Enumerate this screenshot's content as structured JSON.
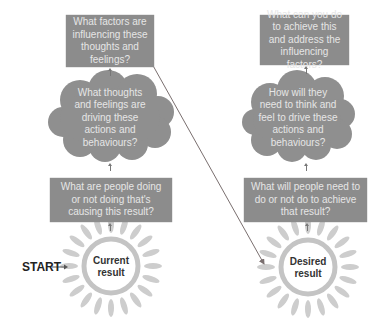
{
  "diagram": {
    "start_label": "START",
    "colors": {
      "box_fill": "#8c8c8c",
      "box_text": "#e6e6e6",
      "cloud_fill": "#8f8f8f",
      "sun_rays": "#c8c8c8",
      "connector_line": "#7a6f6f"
    },
    "left_column": {
      "top_box": "What factors are influencing these thoughts and feelings?",
      "cloud": "What thoughts and feelings are driving these actions and behaviours?",
      "middle_box": "What are people doing or not doing that's causing this result?",
      "sun": "Current result"
    },
    "right_column": {
      "top_box": "What can you do to achieve this and address the influencing factors?",
      "cloud": "How will they need to think and feel to drive these actions and behaviours?",
      "middle_box": "What will people need to do or not do to achieve that result?",
      "sun": "Desired result"
    }
  }
}
